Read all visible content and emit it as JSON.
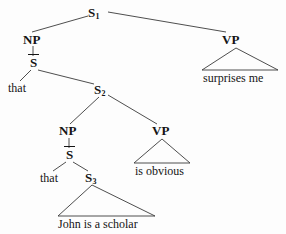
{
  "figure": {
    "kind": "syntax-tree",
    "background_color": "#fdfdfd",
    "line_color": "#3a3a3a",
    "text_color": "#141414"
  },
  "nodes": {
    "s1": {
      "label": "S",
      "subscript": "1"
    },
    "np1": {
      "label": "NP"
    },
    "sbar1": {
      "label": "S",
      "bar": true
    },
    "that1": {
      "label": "that"
    },
    "s2": {
      "label": "S",
      "subscript": "2"
    },
    "np2": {
      "label": "NP"
    },
    "sbar2": {
      "label": "S",
      "bar": true
    },
    "that2": {
      "label": "that"
    },
    "s3": {
      "label": "S",
      "subscript": "3"
    },
    "vp1": {
      "label": "VP"
    },
    "vp1_terminal": {
      "label": "surprises  me"
    },
    "vp2": {
      "label": "VP"
    },
    "vp2_terminal": {
      "label": "is  obvious"
    },
    "s3_terminal": {
      "label": "John  is  a  scholar"
    }
  }
}
